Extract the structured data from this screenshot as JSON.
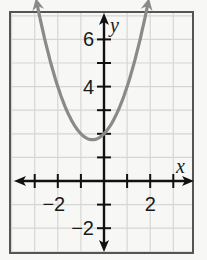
{
  "chart_data": {
    "type": "line",
    "title": "",
    "xlabel": "x",
    "ylabel": "y",
    "xlim": [
      -4,
      4
    ],
    "ylim": [
      -3,
      7
    ],
    "grid": true,
    "grid_step": 1,
    "x_tick_labels": [
      {
        "value": -2,
        "label": "−2"
      },
      {
        "value": 2,
        "label": "2"
      }
    ],
    "y_tick_labels": [
      {
        "value": 6,
        "label": "6"
      },
      {
        "value": 4,
        "label": "4"
      },
      {
        "value": -2,
        "label": "−2"
      }
    ],
    "series": [
      {
        "name": "parabola",
        "equation": "y = x^2 + x + 2",
        "vertex": [
          -0.5,
          1.75
        ],
        "y_intercept": 2,
        "color": "#8a8a8a",
        "arrows_both_ends": true,
        "x": [
          -2.95,
          -2.5,
          -2,
          -1.5,
          -1,
          -0.5,
          0,
          0.5,
          1,
          1.5,
          1.95
        ],
        "y": [
          7.75,
          5.75,
          4,
          2.75,
          2,
          1.75,
          2,
          2.75,
          4,
          5.75,
          7.75
        ]
      }
    ]
  },
  "colors": {
    "background": "#f7f7f5",
    "frame": "#555555",
    "grid": "#d6d6d6",
    "axes": "#111111",
    "curve": "#8a8a8a"
  }
}
